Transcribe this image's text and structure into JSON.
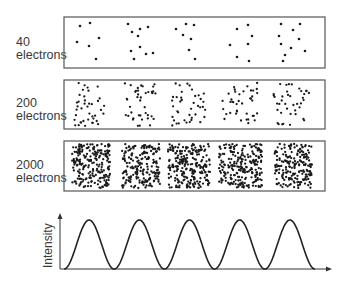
{
  "panels": [
    {
      "id": "p40",
      "count_label": "40",
      "unit_label": "electrons",
      "box": {
        "x": 64,
        "y": 17,
        "w": 261,
        "h": 51
      },
      "points": [
        [
          80,
          26
        ],
        [
          90,
          23
        ],
        [
          77,
          42
        ],
        [
          89,
          46
        ],
        [
          99,
          38
        ],
        [
          96,
          59
        ],
        [
          128,
          24
        ],
        [
          132,
          32
        ],
        [
          140,
          29
        ],
        [
          148,
          27
        ],
        [
          138,
          36
        ],
        [
          140,
          47
        ],
        [
          131,
          51
        ],
        [
          146,
          54
        ],
        [
          153,
          53
        ],
        [
          134,
          59
        ],
        [
          176,
          29
        ],
        [
          186,
          24
        ],
        [
          194,
          25
        ],
        [
          183,
          35
        ],
        [
          191,
          39
        ],
        [
          189,
          50
        ],
        [
          195,
          59
        ],
        [
          237,
          29
        ],
        [
          248,
          25
        ],
        [
          252,
          36
        ],
        [
          230,
          45
        ],
        [
          248,
          44
        ],
        [
          237,
          57
        ],
        [
          249,
          61
        ],
        [
          281,
          24
        ],
        [
          300,
          24
        ],
        [
          293,
          30
        ],
        [
          279,
          36
        ],
        [
          299,
          39
        ],
        [
          281,
          44
        ],
        [
          291,
          48
        ],
        [
          305,
          51
        ],
        [
          285,
          55
        ],
        [
          283,
          61
        ]
      ]
    },
    {
      "id": "p200",
      "count_label": "200",
      "unit_label": "electrons",
      "box": {
        "x": 64,
        "y": 80,
        "w": 261,
        "h": 49
      },
      "clusters": [
        {
          "cx": 89,
          "hw": 16,
          "n": 40
        },
        {
          "cx": 140,
          "hw": 16,
          "n": 40
        },
        {
          "cx": 189,
          "hw": 17,
          "n": 40
        },
        {
          "cx": 240,
          "hw": 18,
          "n": 40
        },
        {
          "cx": 291,
          "hw": 18,
          "n": 40
        }
      ],
      "seed": 7
    },
    {
      "id": "p2000",
      "count_label": "2000",
      "unit_label": "electrons",
      "box": {
        "x": 64,
        "y": 141,
        "w": 261,
        "h": 50
      },
      "clusters": [
        {
          "cx": 91,
          "hw": 19,
          "n": 220
        },
        {
          "cx": 141,
          "hw": 19,
          "n": 200
        },
        {
          "cx": 189,
          "hw": 21,
          "n": 240
        },
        {
          "cx": 241,
          "hw": 22,
          "n": 230
        },
        {
          "cx": 293,
          "hw": 19,
          "n": 200
        }
      ],
      "seed": 13
    }
  ],
  "intensity_plot": {
    "ylabel": "Intensity",
    "axis": {
      "x0": 60,
      "y_base": 269,
      "y_top": 213,
      "x_end": 332
    },
    "curve": {
      "x_start": 64,
      "x_end": 315,
      "period": 50.2,
      "y_min": 269,
      "y_max": 220
    }
  },
  "chart_data": {
    "type": "line",
    "title": "",
    "xlabel": "",
    "ylabel": "Intensity",
    "peaks": 5,
    "x": [
      0,
      0.5,
      1,
      1.5,
      2,
      2.5,
      3,
      3.5,
      4,
      4.5,
      5
    ],
    "values": [
      0,
      1,
      0,
      1,
      0,
      1,
      0,
      1,
      0,
      1,
      0
    ],
    "panels": [
      "40 electrons",
      "200 electrons",
      "2000 electrons"
    ]
  },
  "colors": {
    "dot": "#1a1a1a",
    "box": "#555555",
    "curve": "#222222",
    "text": "#3a3a3a"
  }
}
